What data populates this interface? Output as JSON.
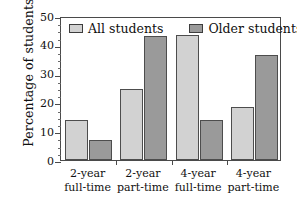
{
  "chart_data": {
    "type": "bar",
    "title": "",
    "xlabel": "",
    "ylabel": "Percentage of students",
    "ylim": [
      0,
      50
    ],
    "ytick_labels": [
      "50",
      "40",
      "30",
      "20",
      "10",
      "0"
    ],
    "ytick_values": [
      50,
      40,
      30,
      20,
      10,
      0
    ],
    "grid": false,
    "legend_position": "top-inside",
    "categories": [
      "2-year\nfull-time",
      "2-year\npart-time",
      "4-year\nfull-time",
      "4-year\npart-time"
    ],
    "category_lines": [
      [
        "2-year",
        "full-time"
      ],
      [
        "2-year",
        "part-time"
      ],
      [
        "4-year",
        "full-time"
      ],
      [
        "4-year",
        "part-time"
      ]
    ],
    "series": [
      {
        "name": "All students",
        "color": "#d2d2d2",
        "values": [
          14,
          24.8,
          43.5,
          18.5
        ]
      },
      {
        "name": "Older students",
        "color": "#9a9a9a",
        "values": [
          7,
          43,
          13.8,
          36.5
        ]
      }
    ]
  },
  "legend": {
    "entries": [
      {
        "label": "All students",
        "swatch_icon": "legend-swatch-light"
      },
      {
        "label": "Older students",
        "swatch_icon": "legend-swatch-dark"
      }
    ]
  },
  "axis": {
    "y_title": "Percentage of students"
  },
  "colors": {
    "series_all_students": "#d2d2d2",
    "series_older_students": "#9a9a9a",
    "frame": "#4a4a4a",
    "bar_border": "#4d4d4d",
    "background": "#ffffff",
    "text": "#101010"
  }
}
